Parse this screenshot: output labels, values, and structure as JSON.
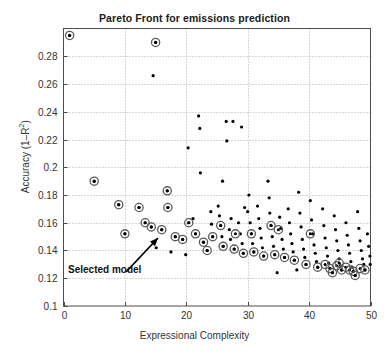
{
  "chart_data": {
    "type": "scatter",
    "title": "Pareto Front for emissions prediction",
    "xlabel": "Expressional Complexity",
    "ylabel": "Accuracy (1–R²)",
    "xlim": [
      0,
      50
    ],
    "ylim": [
      0.1,
      0.3
    ],
    "xticks": [
      0,
      10,
      20,
      30,
      40,
      50
    ],
    "xtick_labels": [
      "0",
      "10",
      "20",
      "30",
      "40",
      "50"
    ],
    "yticks": [
      0.1,
      0.12,
      0.14,
      0.16,
      0.18,
      0.2,
      0.22,
      0.24,
      0.26,
      0.28
    ],
    "ytick_labels": [
      "0.1",
      "0.12",
      "0.14",
      "0.16",
      "0.18",
      "0.2",
      "0.22",
      "0.24",
      "0.26",
      "0.28"
    ],
    "grid": true,
    "grid_style": "dotted",
    "legend": null,
    "series": [
      {
        "name": "models",
        "marker": "dot",
        "color": "#000000",
        "points": [
          [
            1.0,
            0.295
          ],
          [
            15.0,
            0.29
          ],
          [
            14.6,
            0.266
          ],
          [
            22.0,
            0.237
          ],
          [
            22.2,
            0.228
          ],
          [
            26.5,
            0.233
          ],
          [
            27.6,
            0.233
          ],
          [
            29.0,
            0.229
          ],
          [
            26.6,
            0.219
          ],
          [
            20.3,
            0.214
          ],
          [
            5.0,
            0.19
          ],
          [
            9.0,
            0.173
          ],
          [
            12.3,
            0.171
          ],
          [
            16.9,
            0.183
          ],
          [
            17.0,
            0.171
          ],
          [
            20.4,
            0.16
          ],
          [
            22.3,
            0.196
          ],
          [
            25.9,
            0.19
          ],
          [
            27.3,
            0.163
          ],
          [
            29.5,
            0.171
          ],
          [
            30.2,
            0.18
          ],
          [
            10.0,
            0.152
          ],
          [
            13.3,
            0.16
          ],
          [
            14.3,
            0.157
          ],
          [
            16.0,
            0.155
          ],
          [
            18.2,
            0.15
          ],
          [
            19.4,
            0.148
          ],
          [
            21.1,
            0.163
          ],
          [
            21.5,
            0.152
          ],
          [
            22.8,
            0.146
          ],
          [
            24.0,
            0.168
          ],
          [
            24.1,
            0.159
          ],
          [
            24.3,
            0.15
          ],
          [
            25.2,
            0.172
          ],
          [
            25.4,
            0.165
          ],
          [
            25.6,
            0.158
          ],
          [
            25.8,
            0.15
          ],
          [
            26.0,
            0.143
          ],
          [
            27.0,
            0.155
          ],
          [
            27.2,
            0.148
          ],
          [
            27.8,
            0.141
          ],
          [
            28.5,
            0.16
          ],
          [
            28.8,
            0.152
          ],
          [
            29.1,
            0.145
          ],
          [
            29.3,
            0.138
          ],
          [
            30.0,
            0.168
          ],
          [
            30.4,
            0.16
          ],
          [
            30.6,
            0.152
          ],
          [
            30.8,
            0.145
          ],
          [
            31.0,
            0.139
          ],
          [
            31.6,
            0.172
          ],
          [
            31.8,
            0.163
          ],
          [
            32.0,
            0.156
          ],
          [
            32.2,
            0.149
          ],
          [
            32.4,
            0.142
          ],
          [
            32.6,
            0.136
          ],
          [
            33.3,
            0.19
          ],
          [
            33.5,
            0.178
          ],
          [
            33.6,
            0.167
          ],
          [
            33.8,
            0.158
          ],
          [
            34.0,
            0.15
          ],
          [
            34.2,
            0.143
          ],
          [
            34.4,
            0.137
          ],
          [
            35.2,
            0.164
          ],
          [
            35.4,
            0.156
          ],
          [
            35.6,
            0.148
          ],
          [
            35.8,
            0.141
          ],
          [
            36.0,
            0.135
          ],
          [
            36.6,
            0.17
          ],
          [
            36.8,
            0.16
          ],
          [
            37.0,
            0.152
          ],
          [
            37.2,
            0.145
          ],
          [
            37.4,
            0.139
          ],
          [
            37.6,
            0.133
          ],
          [
            38.3,
            0.182
          ],
          [
            38.5,
            0.167
          ],
          [
            38.7,
            0.157
          ],
          [
            38.9,
            0.148
          ],
          [
            39.1,
            0.141
          ],
          [
            39.3,
            0.135
          ],
          [
            39.5,
            0.13
          ],
          [
            40.2,
            0.176
          ],
          [
            40.4,
            0.162
          ],
          [
            40.6,
            0.152
          ],
          [
            40.8,
            0.144
          ],
          [
            41.0,
            0.138
          ],
          [
            41.2,
            0.132
          ],
          [
            41.4,
            0.128
          ],
          [
            42.2,
            0.17
          ],
          [
            42.4,
            0.158
          ],
          [
            42.6,
            0.149
          ],
          [
            42.8,
            0.142
          ],
          [
            43.0,
            0.136
          ],
          [
            43.2,
            0.131
          ],
          [
            43.4,
            0.127
          ],
          [
            44.1,
            0.165
          ],
          [
            44.3,
            0.155
          ],
          [
            44.5,
            0.147
          ],
          [
            44.7,
            0.14
          ],
          [
            44.9,
            0.134
          ],
          [
            45.1,
            0.129
          ],
          [
            45.3,
            0.126
          ],
          [
            46.0,
            0.16
          ],
          [
            46.2,
            0.151
          ],
          [
            46.4,
            0.144
          ],
          [
            46.6,
            0.138
          ],
          [
            46.8,
            0.132
          ],
          [
            47.0,
            0.128
          ],
          [
            47.2,
            0.125
          ],
          [
            47.9,
            0.168
          ],
          [
            48.1,
            0.156
          ],
          [
            48.3,
            0.147
          ],
          [
            48.5,
            0.14
          ],
          [
            48.7,
            0.134
          ],
          [
            48.9,
            0.13
          ],
          [
            49.1,
            0.126
          ],
          [
            49.5,
            0.152
          ],
          [
            49.7,
            0.143
          ],
          [
            49.9,
            0.136
          ],
          [
            49.95,
            0.13
          ],
          [
            34.8,
            0.124
          ],
          [
            38.0,
            0.126
          ],
          [
            43.8,
            0.124
          ],
          [
            47.5,
            0.122
          ],
          [
            23.4,
            0.14
          ],
          [
            19.9,
            0.137
          ],
          [
            17.5,
            0.139
          ],
          [
            15.1,
            0.142
          ]
        ]
      },
      {
        "name": "pareto-front",
        "marker": "circled-dot",
        "color": "#000000",
        "points": [
          [
            1.0,
            0.295
          ],
          [
            15.0,
            0.29
          ],
          [
            5.0,
            0.19
          ],
          [
            9.0,
            0.173
          ],
          [
            12.3,
            0.171
          ],
          [
            16.9,
            0.183
          ],
          [
            17.0,
            0.171
          ],
          [
            16.0,
            0.155
          ],
          [
            20.4,
            0.16
          ],
          [
            21.5,
            0.152
          ],
          [
            19.4,
            0.148
          ],
          [
            18.2,
            0.15
          ],
          [
            22.8,
            0.146
          ],
          [
            24.3,
            0.15
          ],
          [
            23.4,
            0.14
          ],
          [
            26.0,
            0.143
          ],
          [
            27.8,
            0.141
          ],
          [
            29.3,
            0.138
          ],
          [
            31.0,
            0.139
          ],
          [
            32.6,
            0.136
          ],
          [
            33.8,
            0.158
          ],
          [
            34.4,
            0.137
          ],
          [
            35.0,
            0.155
          ],
          [
            36.0,
            0.135
          ],
          [
            37.6,
            0.133
          ],
          [
            39.5,
            0.13
          ],
          [
            40.2,
            0.152
          ],
          [
            41.4,
            0.128
          ],
          [
            42.6,
            0.13
          ],
          [
            43.4,
            0.127
          ],
          [
            43.8,
            0.124
          ],
          [
            44.5,
            0.129
          ],
          [
            45.3,
            0.126
          ],
          [
            46.0,
            0.128
          ],
          [
            46.6,
            0.126
          ],
          [
            47.2,
            0.125
          ],
          [
            47.5,
            0.122
          ],
          [
            48.3,
            0.127
          ],
          [
            49.1,
            0.126
          ],
          [
            44.9,
            0.131
          ],
          [
            14.3,
            0.157
          ],
          [
            13.3,
            0.16
          ],
          [
            10.0,
            0.152
          ],
          [
            25.6,
            0.158
          ],
          [
            28.0,
            0.152
          ],
          [
            30.6,
            0.152
          ]
        ]
      }
    ],
    "annotations": [
      {
        "text": "Selected model",
        "text_x": 68,
        "text_y": 264,
        "arrow_from_x": 126,
        "arrow_from_y": 272,
        "arrow_to_x": 158,
        "arrow_to_y": 238
      }
    ]
  }
}
